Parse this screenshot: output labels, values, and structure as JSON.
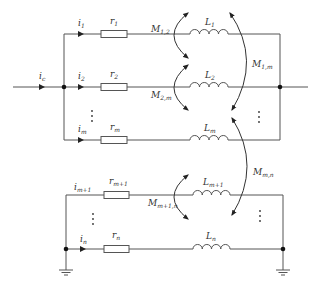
{
  "diagram": {
    "type": "parallel-branch circuit with mutual inductance",
    "input_current": {
      "label": "i",
      "sub": "c"
    },
    "upper_group": {
      "branches": [
        {
          "current": {
            "label": "i",
            "sub": "1"
          },
          "resistor": {
            "label": "r",
            "sub": "1"
          },
          "inductor": {
            "label": "L",
            "sub": "1"
          }
        },
        {
          "current": {
            "label": "i",
            "sub": "2"
          },
          "resistor": {
            "label": "r",
            "sub": "2"
          },
          "inductor": {
            "label": "L",
            "sub": "2"
          }
        },
        {
          "current": {
            "label": "i",
            "sub": "m"
          },
          "resistor": {
            "label": "r",
            "sub": "m"
          },
          "inductor": {
            "label": "L",
            "sub": "m"
          }
        }
      ],
      "ellipsis": "⋮"
    },
    "lower_group": {
      "branches": [
        {
          "current": {
            "label": "i",
            "sub": "m+1"
          },
          "resistor": {
            "label": "r",
            "sub": "m+1"
          },
          "inductor": {
            "label": "L",
            "sub": "m+1"
          }
        },
        {
          "current": {
            "label": "i",
            "sub": "n"
          },
          "resistor": {
            "label": "r",
            "sub": "n"
          },
          "inductor": {
            "label": "L",
            "sub": "n"
          }
        }
      ],
      "ellipsis": "⋮"
    },
    "mutual_inductances": [
      {
        "label": "M",
        "sub": "1,2"
      },
      {
        "label": "M",
        "sub": "2,m"
      },
      {
        "label": "M",
        "sub": "1,m"
      },
      {
        "label": "M",
        "sub": "m,n"
      },
      {
        "label": "M",
        "sub": "m+1,n"
      }
    ],
    "colors": {
      "wire": "#555555",
      "text": "#333333",
      "background": "#ffffff"
    }
  }
}
